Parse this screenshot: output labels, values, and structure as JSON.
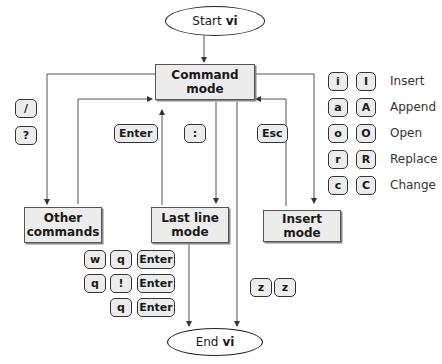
{
  "start": {
    "prefix": "Start",
    "name": "vi"
  },
  "end": {
    "prefix": "End",
    "name": "vi"
  },
  "modes": {
    "command": "Command mode",
    "other_line1": "Other",
    "other_line2": "commands",
    "lastline_line1": "Last line",
    "lastline_line2": "mode",
    "insert": "Insert mode"
  },
  "keys": {
    "slash": "/",
    "question": "?",
    "enter": "Enter",
    "colon": ":",
    "esc": "Esc",
    "quit_seq": [
      [
        "w",
        "q",
        "Enter"
      ],
      [
        "q",
        "!",
        "Enter"
      ],
      [
        "q",
        "Enter"
      ]
    ],
    "zz": [
      "z",
      "z"
    ]
  },
  "insert_commands": [
    {
      "lower": "i",
      "upper": "I",
      "label": "Insert"
    },
    {
      "lower": "a",
      "upper": "A",
      "label": "Append"
    },
    {
      "lower": "o",
      "upper": "O",
      "label": "Open"
    },
    {
      "lower": "r",
      "upper": "R",
      "label": "Replace"
    },
    {
      "lower": "c",
      "upper": "C",
      "label": "Change"
    }
  ]
}
